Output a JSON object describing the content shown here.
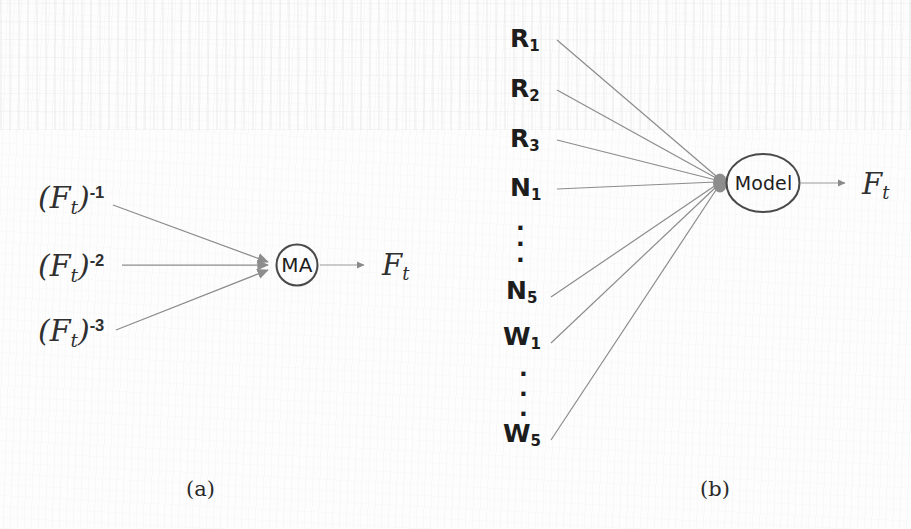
{
  "figure": {
    "type": "diagram",
    "line_color": "#8c8c8c",
    "text_color": "#252525",
    "background_color": "#fdfdfd"
  },
  "panel_a": {
    "caption": "(a)",
    "inputs": [
      {
        "base": "F",
        "sub": "t",
        "exp": "-1",
        "full": "(F_t)^-1"
      },
      {
        "base": "F",
        "sub": "t",
        "exp": "-2",
        "full": "(F_t)^-2"
      },
      {
        "base": "F",
        "sub": "t",
        "exp": "-3",
        "full": "(F_t)^-3"
      }
    ],
    "node": {
      "label": "MA",
      "shape": "circle"
    },
    "output": {
      "base": "F",
      "sub": "t",
      "full": "F_t"
    }
  },
  "panel_b": {
    "caption": "(b)",
    "inputs": [
      {
        "base": "R",
        "sub": "1",
        "full": "R_1",
        "kind": "label"
      },
      {
        "base": "R",
        "sub": "2",
        "full": "R_2",
        "kind": "label"
      },
      {
        "base": "R",
        "sub": "3",
        "full": "R_3",
        "kind": "label"
      },
      {
        "base": "N",
        "sub": "1",
        "full": "N_1",
        "kind": "label"
      },
      {
        "base": "",
        "sub": "",
        "full": "⋮",
        "kind": "ellipsis"
      },
      {
        "base": "N",
        "sub": "5",
        "full": "N_5",
        "kind": "label"
      },
      {
        "base": "W",
        "sub": "1",
        "full": "W_1",
        "kind": "label"
      },
      {
        "base": "",
        "sub": "",
        "full": "⋮",
        "kind": "ellipsis"
      },
      {
        "base": "W",
        "sub": "5",
        "full": "W_5",
        "kind": "label"
      }
    ],
    "node": {
      "label": "Model",
      "shape": "ellipse"
    },
    "output": {
      "base": "F",
      "sub": "t",
      "full": "F_t"
    }
  }
}
